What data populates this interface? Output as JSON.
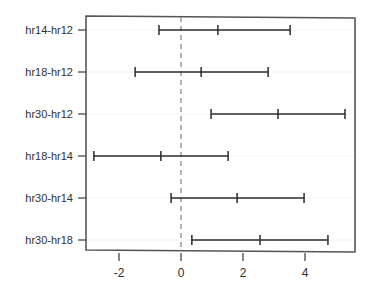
{
  "chart_data": {
    "type": "line",
    "title": "",
    "subtitle": "",
    "xlabel": "",
    "ylabel": "",
    "orientation": "horizontal",
    "grid": true,
    "legend": null,
    "xlim": [
      -3.06,
      5.61
    ],
    "xticks": [
      -2,
      0,
      2,
      4
    ],
    "xticklabels": [
      "-2",
      "0",
      "2",
      "4"
    ],
    "reference_line": {
      "value": 0,
      "style": "dashed",
      "color": "#8a8a8a"
    },
    "categories": [
      "hr14-hr12",
      "hr18-hr12",
      "hr30-hr12",
      "hr18-hr14",
      "hr30-hr14",
      "hr30-hr18"
    ],
    "series": [
      {
        "name": "difference in means",
        "values": [
          1.19,
          0.65,
          3.13,
          -0.65,
          1.81,
          2.55
        ]
      },
      {
        "name": "lower confidence limit",
        "values": [
          -0.71,
          -1.48,
          0.97,
          -2.81,
          -0.32,
          0.35
        ]
      },
      {
        "name": "upper confidence limit",
        "values": [
          3.52,
          2.81,
          5.29,
          1.52,
          3.97,
          4.74
        ]
      }
    ],
    "points": [
      {
        "category": "hr14-hr12",
        "lower": -0.71,
        "center": 1.19,
        "upper": 3.52
      },
      {
        "category": "hr18-hr12",
        "lower": -1.48,
        "center": 0.65,
        "upper": 2.81
      },
      {
        "category": "hr30-hr12",
        "lower": 0.97,
        "center": 3.13,
        "upper": 5.29
      },
      {
        "category": "hr18-hr14",
        "lower": -2.81,
        "center": -0.65,
        "upper": 1.52
      },
      {
        "category": "hr30-hr14",
        "lower": -0.32,
        "center": 1.81,
        "upper": 3.97
      },
      {
        "category": "hr30-hr18",
        "lower": 0.35,
        "center": 2.55,
        "upper": 4.74
      }
    ],
    "colors": {
      "interval": "#2b2b2b",
      "frame": "#555555",
      "grid": "#f2f2f2",
      "zero": "#8a8a8a",
      "text": "#303030"
    }
  }
}
